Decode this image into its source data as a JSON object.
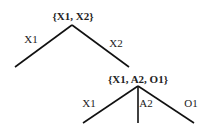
{
  "tree": {
    "root": {
      "label": "{X1, X2}"
    },
    "root_edges": [
      {
        "label": "X1"
      },
      {
        "label": "X2"
      }
    ],
    "child": {
      "label": "{X1, A2, O1}"
    },
    "child_edges": [
      {
        "label": "X1"
      },
      {
        "label": "A2"
      },
      {
        "label": "O1"
      }
    ]
  }
}
